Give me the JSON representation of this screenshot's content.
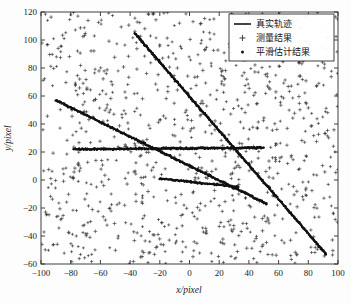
{
  "chart_data": {
    "type": "scatter",
    "title": "",
    "xlabel": "x/pixel",
    "ylabel": "y/pixel",
    "xlim": [
      -100,
      100
    ],
    "ylim": [
      -60,
      120
    ],
    "xticks": [
      -100,
      -80,
      -60,
      -40,
      -20,
      0,
      20,
      40,
      60,
      80,
      100
    ],
    "yticks": [
      -60,
      -40,
      -20,
      0,
      20,
      40,
      60,
      80,
      100,
      120
    ],
    "xtick_labels": [
      "−100",
      "−80",
      "−60",
      "−40",
      "−20",
      "0",
      "20",
      "40",
      "60",
      "80",
      "100"
    ],
    "ytick_labels": [
      "−60",
      "−40",
      "−20",
      "0",
      "20",
      "40",
      "60",
      "80",
      "100",
      "120"
    ],
    "grid": false,
    "legend_position": "upper right",
    "legend": [
      {
        "label": "真实轨迹",
        "marker": "line",
        "color": "#151515"
      },
      {
        "label": "测量结果",
        "marker": "plus",
        "color": "#2e2e2e"
      },
      {
        "label": "平滑估计结果",
        "marker": "dot",
        "color": "#111111"
      }
    ],
    "series": [
      {
        "name": "真实轨迹 1",
        "type": "line",
        "points": [
          [
            -37,
            105
          ],
          [
            92,
            -53
          ]
        ]
      },
      {
        "name": "真实轨迹 2",
        "type": "line",
        "points": [
          [
            -90,
            57
          ],
          [
            52,
            -17
          ]
        ]
      },
      {
        "name": "真实轨迹 3",
        "type": "line",
        "points": [
          [
            -78,
            22
          ],
          [
            50,
            23
          ]
        ]
      },
      {
        "name": "真实轨迹 4",
        "type": "line",
        "points": [
          [
            -20,
            1
          ],
          [
            33,
            -5
          ]
        ]
      }
    ],
    "measurement_noise": {
      "name": "测量结果",
      "marker": "plus",
      "count": 900,
      "distribution": "uniform",
      "x_range": [
        -100,
        100
      ],
      "y_range": [
        -60,
        120
      ]
    },
    "smoothed_estimate": {
      "name": "平滑估计结果",
      "marker": "dot",
      "description": "dense dot markers overlying the four true tracks"
    }
  },
  "axes": {
    "x_title": "x/pixel",
    "y_title": "y/pixel"
  }
}
